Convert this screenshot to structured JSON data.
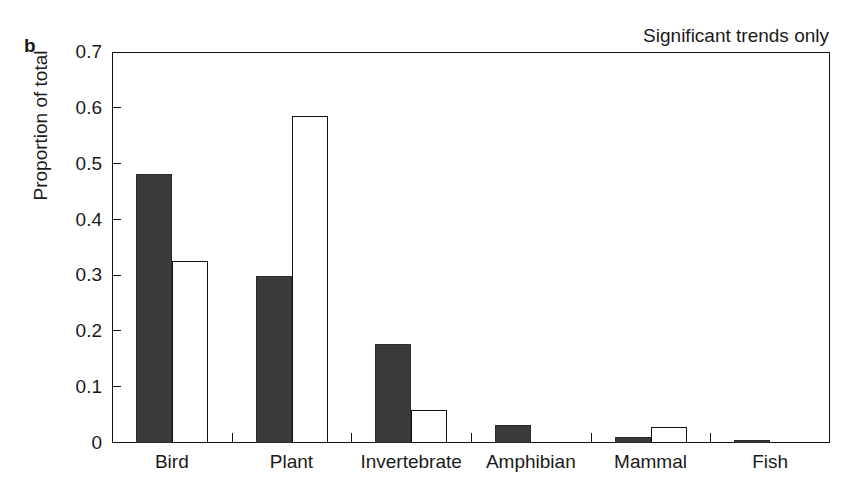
{
  "panel": {
    "letter": "b"
  },
  "chart_data": {
    "type": "bar",
    "title": "Significant trends only",
    "xlabel": "",
    "ylabel": "Proportion of total",
    "ylim": [
      0,
      0.7
    ],
    "ytick_labels": [
      "0",
      "0.1",
      "0.2",
      "0.3",
      "0.4",
      "0.5",
      "0.6",
      "0.7"
    ],
    "ytick_values": [
      0,
      0.1,
      0.2,
      0.3,
      0.4,
      0.5,
      0.6,
      0.7
    ],
    "grid": false,
    "legend": "none",
    "categories": [
      "Bird",
      "Plant",
      "Invertebrate",
      "Amphibian",
      "Mammal",
      "Fish"
    ],
    "series": [
      {
        "name": "filled",
        "style": "solid-dark",
        "color": "#3a3a3a",
        "values": [
          0.481,
          0.299,
          0.178,
          0.032,
          0.01,
          0.006
        ]
      },
      {
        "name": "open",
        "style": "open-white",
        "color": "#ffffff",
        "values": [
          0.326,
          0.586,
          0.059,
          0.0,
          0.029,
          0.0
        ]
      }
    ]
  }
}
